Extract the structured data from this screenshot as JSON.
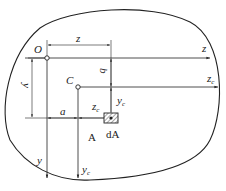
{
  "diagram": {
    "type": "cross-section-parallel-axis",
    "region_label": "A",
    "element_label": "dA",
    "points": {
      "origin": {
        "label": "O"
      },
      "centroid": {
        "label": "C"
      }
    },
    "axes": {
      "z": {
        "label": "z"
      },
      "y": {
        "label": "y"
      },
      "zc": {
        "label": "z",
        "subscript": "c"
      },
      "yc": {
        "label": "y",
        "subscript": "c"
      }
    },
    "dimensions": {
      "z": {
        "label": "z"
      },
      "y": {
        "label": "y"
      },
      "a": {
        "label": "a"
      },
      "b": {
        "label": "b"
      },
      "zc": {
        "label": "z",
        "subscript": "c"
      },
      "yc": {
        "label": "y",
        "subscript": "c"
      }
    },
    "colors": {
      "line": "#222222",
      "background": "#ffffff"
    }
  }
}
